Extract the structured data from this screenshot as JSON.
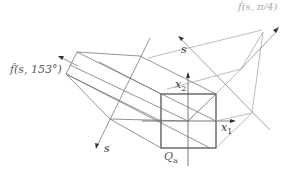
{
  "diagram": {
    "type": "geometric projection diagram",
    "labels": {
      "f_153": "f̂(s, 153°)",
      "f_pi4": "f̂(s, π/4)",
      "s_upper": "s",
      "s_lower": "s",
      "x1": "x",
      "x1_sub": "1",
      "x2": "x",
      "x2_sub": "2",
      "Qa": "Q",
      "Qa_sub": "a"
    },
    "colors": {
      "dark_line": "#555555",
      "mid_line": "#888888",
      "light_line": "#bbbbbb",
      "label": "#333333",
      "label_light": "#aaaaaa"
    }
  }
}
